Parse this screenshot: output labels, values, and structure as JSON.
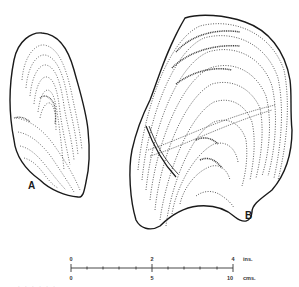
{
  "figure": {
    "specimens": [
      {
        "id": "A",
        "label": "A",
        "description": "smaller shell valve, elongated oval with growth lines"
      },
      {
        "id": "B",
        "label": "B",
        "description": "larger shell valve, fan-shaped with concentric growth lines and a crack"
      }
    ],
    "scale_bar": {
      "inches": {
        "ticks": [
          "0",
          "2",
          "4"
        ],
        "unit": "ins."
      },
      "centimeters": {
        "ticks": [
          "0",
          "5",
          "10"
        ],
        "unit": "cms."
      },
      "minor_divisions": 10
    },
    "caption_partial": "· · · · · ·"
  },
  "colors": {
    "ink": "#1a1a1a",
    "background": "#ffffff"
  }
}
